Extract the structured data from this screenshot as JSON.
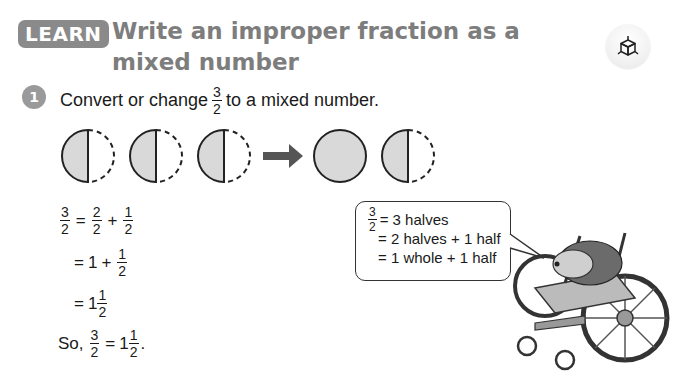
{
  "header": {
    "badge_label": "LEARN",
    "title": "Write an improper fraction as a mixed number",
    "icon": "3d-cube-icon"
  },
  "colors": {
    "badge_bg": "#8a8a8a",
    "title_text": "#7d7d7d",
    "step_badge_bg": "#9a9a9a",
    "shaded_half": "#d9d9d9"
  },
  "step": {
    "number": "1",
    "prompt_before": "Convert or change",
    "fraction": {
      "num": "3",
      "den": "2"
    },
    "prompt_after": "to a mixed number."
  },
  "diagram": {
    "left_group": [
      "half",
      "half",
      "half"
    ],
    "arrow": "right-arrow",
    "right_group": [
      "whole",
      "half"
    ]
  },
  "working": {
    "line1": {
      "lhs": {
        "num": "3",
        "den": "2"
      },
      "eq": "=",
      "t1": {
        "num": "2",
        "den": "2"
      },
      "plus": "+",
      "t2": {
        "num": "1",
        "den": "2"
      }
    },
    "line2": {
      "eq": "=",
      "whole": "1",
      "plus": "+",
      "t": {
        "num": "1",
        "den": "2"
      }
    },
    "line3": {
      "eq": "=",
      "whole": "1",
      "t": {
        "num": "1",
        "den": "2"
      }
    },
    "line4": {
      "so": "So,",
      "lhs": {
        "num": "3",
        "den": "2"
      },
      "eq": "=",
      "whole": "1",
      "t": {
        "num": "1",
        "den": "2"
      },
      "period": "."
    }
  },
  "speech_bubble": {
    "frac": {
      "num": "3",
      "den": "2"
    },
    "line1": "= 3 halves",
    "line2": "= 2 halves + 1 half",
    "line3": "= 1 whole + 1 half"
  },
  "illustration": {
    "subject": "hedgehog-in-wheelchair"
  }
}
